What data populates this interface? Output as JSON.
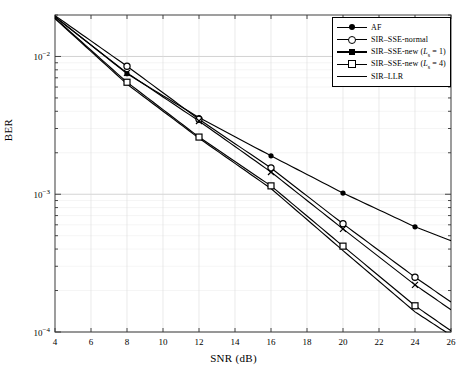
{
  "chart_data": {
    "type": "line",
    "title": "",
    "xlabel": "SNR (dB)",
    "ylabel": "BER",
    "xlim": [
      4,
      26
    ],
    "ylim": [
      0.0001,
      0.02
    ],
    "yscale": "log",
    "grid": true,
    "legend_position": "top-right",
    "xticks": [
      4,
      6,
      8,
      10,
      12,
      14,
      16,
      18,
      20,
      22,
      24,
      26
    ],
    "xtick_labels": [
      "4",
      "6",
      "8",
      "10",
      "12",
      "14",
      "16",
      "18",
      "20",
      "22",
      "24",
      "26"
    ],
    "ytick_labels": [
      "10^-2",
      "10^-3",
      "10^-4"
    ],
    "ytick_values": [
      0.01,
      0.001,
      0.0001
    ],
    "x": [
      4,
      8,
      12,
      16,
      20,
      24,
      26
    ],
    "series": [
      {
        "name": "AF",
        "marker": "filled-circle",
        "values": [
          0.0195,
          0.0075,
          0.0036,
          0.0019,
          0.00102,
          0.00058,
          0.00046
        ]
      },
      {
        "name": "SIR-SSE-normal",
        "marker": "open-circle",
        "values": [
          0.0198,
          0.0085,
          0.0035,
          0.00155,
          0.00061,
          0.00025,
          0.000165
        ]
      },
      {
        "name": "SIR-SSE-new (L_s = 1)",
        "marker": "x-cross",
        "values": [
          0.0193,
          0.0076,
          0.0034,
          0.00145,
          0.00056,
          0.00022,
          0.000145
        ]
      },
      {
        "name": "SIR-SSE-new (L_s = 4)",
        "marker": "open-square",
        "values": [
          0.019,
          0.0065,
          0.0026,
          0.00115,
          0.00042,
          0.000155,
          0.000102
        ]
      },
      {
        "name": "SIR-LLR",
        "marker": "none",
        "values": [
          0.0188,
          0.0063,
          0.00255,
          0.0011,
          0.00039,
          0.00014,
          9.45e-05
        ]
      }
    ]
  },
  "legend": {
    "items": [
      {
        "label": "AF",
        "marker": "filled-circle"
      },
      {
        "label": "SIR–SSE-normal",
        "marker": "open-circle"
      },
      {
        "label_pre": "SIR–SSE-new (",
        "label_sub": "L",
        "label_sub2": "s",
        "label_post": " = 1)",
        "marker": "x-cross"
      },
      {
        "label_pre": "SIR–SSE-new (",
        "label_sub": "L",
        "label_sub2": "s",
        "label_post": " = 4)",
        "marker": "open-square"
      },
      {
        "label": "SIR–LLR",
        "marker": "none"
      }
    ]
  }
}
